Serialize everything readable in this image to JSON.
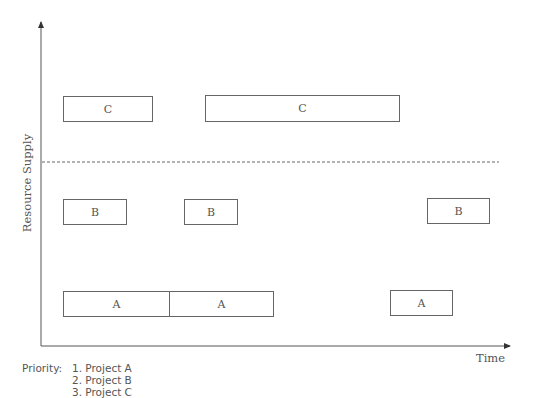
{
  "diagram": {
    "y_axis_label": "Resource Supply",
    "x_axis_label": "Time",
    "capacity_line": "dashed",
    "blocks": [
      {
        "project": "C",
        "label": "C",
        "x": 63,
        "y": 96,
        "w": 90,
        "h": 26
      },
      {
        "project": "C",
        "label": "C",
        "x": 205,
        "y": 95,
        "w": 195,
        "h": 27
      },
      {
        "project": "B",
        "label": "B",
        "x": 63,
        "y": 199,
        "w": 64,
        "h": 26
      },
      {
        "project": "B",
        "label": "B",
        "x": 184,
        "y": 199,
        "w": 54,
        "h": 26
      },
      {
        "project": "B",
        "label": "B",
        "x": 427,
        "y": 198,
        "w": 63,
        "h": 26
      },
      {
        "project": "A",
        "label": "A",
        "x": 63,
        "y": 291,
        "w": 107,
        "h": 26
      },
      {
        "project": "A",
        "label": "A",
        "x": 169,
        "y": 291,
        "w": 105,
        "h": 26
      },
      {
        "project": "A",
        "label": "A",
        "x": 390,
        "y": 290,
        "w": 63,
        "h": 26
      }
    ],
    "priority": {
      "title": "Priority:",
      "items": [
        "1. Project A",
        "2. Project B",
        "3. Project C"
      ]
    }
  }
}
